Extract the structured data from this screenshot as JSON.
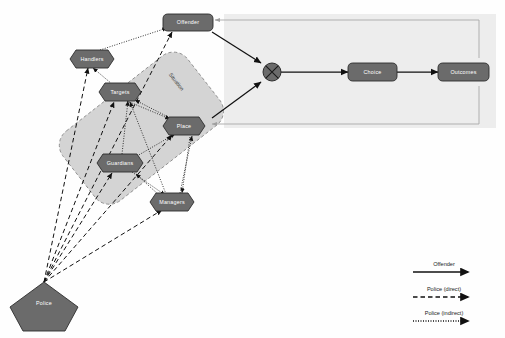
{
  "diagram": {
    "palette": {
      "node_fill": "#6b6b6b",
      "node_stroke": "#2e2e2e",
      "node_text": "#ffffff",
      "panel_fill": "#d4d4d4",
      "panel_stroke": "#9a9a9a",
      "right_panel_fill": "#ededed",
      "feedback_line": "#a8a8a8",
      "offender_line": "#111111",
      "police_line": "#111111",
      "page_bg": "#fefefe"
    },
    "situation_panel": {
      "label": "Situation"
    },
    "nodes": [
      {
        "id": "offender",
        "label": "Offender",
        "shape": "rounded-rect",
        "x": 188,
        "y": 22
      },
      {
        "id": "handlers",
        "label": "Handlers",
        "shape": "hexagon",
        "x": 92,
        "y": 59
      },
      {
        "id": "targets",
        "label": "Targets",
        "shape": "hexagon",
        "x": 120,
        "y": 92
      },
      {
        "id": "place",
        "label": "Place",
        "shape": "hexagon",
        "x": 184,
        "y": 126
      },
      {
        "id": "guardians",
        "label": "Guardians",
        "shape": "hexagon",
        "x": 120,
        "y": 163
      },
      {
        "id": "managers",
        "label": "Managers",
        "shape": "hexagon",
        "x": 172,
        "y": 202
      },
      {
        "id": "junction",
        "label": "",
        "shape": "crossed-circle",
        "x": 272,
        "y": 72
      },
      {
        "id": "choice",
        "label": "Choice",
        "shape": "rounded-rect",
        "x": 372,
        "y": 72
      },
      {
        "id": "outcomes",
        "label": "Outcomes",
        "shape": "rounded-rect",
        "x": 462,
        "y": 72
      },
      {
        "id": "police",
        "label": "Police",
        "shape": "pentagon",
        "x": 42,
        "y": 300
      }
    ],
    "edges": [
      {
        "from": "handlers",
        "to": "offender",
        "style": "dotted"
      },
      {
        "from": "targets",
        "to": "handlers",
        "style": "dotted"
      },
      {
        "from": "guardians",
        "to": "targets",
        "style": "dotted"
      },
      {
        "from": "managers",
        "to": "guardians",
        "style": "dotted"
      },
      {
        "from": "place",
        "to": "targets",
        "style": "dotted"
      },
      {
        "from": "managers",
        "to": "place",
        "style": "dotted"
      },
      {
        "from": "guardians",
        "to": "place",
        "style": "dotted"
      },
      {
        "from": "targets",
        "to": "place",
        "style": "dotted"
      },
      {
        "from": "offender",
        "to": "junction",
        "style": "solid"
      },
      {
        "from": "place",
        "to": "junction",
        "style": "solid"
      },
      {
        "from": "junction",
        "to": "choice",
        "style": "solid"
      },
      {
        "from": "choice",
        "to": "outcomes",
        "style": "solid"
      },
      {
        "from": "outcomes",
        "to": "offender",
        "style": "feedback"
      },
      {
        "from": "outcomes",
        "to": "place",
        "style": "feedback"
      },
      {
        "from": "police",
        "to": "offender",
        "style": "dashed"
      },
      {
        "from": "police",
        "to": "handlers",
        "style": "dashed"
      },
      {
        "from": "police",
        "to": "targets",
        "style": "dashed"
      },
      {
        "from": "police",
        "to": "place",
        "style": "dashed"
      },
      {
        "from": "police",
        "to": "guardians",
        "style": "dashed"
      },
      {
        "from": "police",
        "to": "managers",
        "style": "dashed"
      }
    ],
    "legend": {
      "items": [
        {
          "label": "Offender",
          "style": "solid"
        },
        {
          "label": "Police (direct)",
          "style": "dashed"
        },
        {
          "label": "Police (indirect)",
          "style": "dotted"
        }
      ]
    }
  }
}
